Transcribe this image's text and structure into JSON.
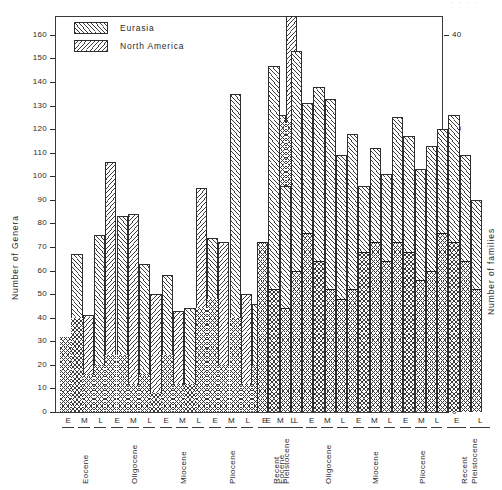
{
  "figure": {
    "left_axis_title": "Number  of  Genera",
    "right_axis_title": "Number  of  families",
    "top_partial_note": "· · · ·"
  },
  "legend": {
    "position": "top-left-inside",
    "entries": [
      {
        "label": "Eurasia",
        "pattern": "diagonal-up-hatch"
      },
      {
        "label": "North America",
        "pattern": "diagonal-down-hatch"
      }
    ]
  },
  "axes": {
    "left": {
      "label": "Number  of  Genera",
      "min": 0,
      "max": 168,
      "tick_step": 10,
      "ticks": [
        0,
        10,
        20,
        30,
        40,
        50,
        60,
        70,
        80,
        90,
        100,
        110,
        120,
        130,
        140,
        150,
        160
      ],
      "tick_labels": [
        "0",
        "10",
        "20",
        "30",
        "40",
        "50",
        "60",
        "70",
        "80",
        "90",
        "100",
        "110",
        "120",
        "130",
        "140",
        "150",
        "160"
      ]
    },
    "right": {
      "label": "Number  of  families",
      "min": 0,
      "max": 42,
      "tick_step": 10,
      "ticks": [
        0,
        10,
        20,
        30,
        40
      ],
      "tick_labels": [
        "0",
        "10",
        "20",
        "30",
        "40"
      ]
    },
    "x": {
      "stage_labels": [
        "E",
        "M",
        "L"
      ],
      "periods": [
        "Eocene",
        "Oligocene",
        "Miocene",
        "Pliocene",
        "Pleistocene Recent"
      ]
    }
  },
  "chart_data": {
    "type": "bar",
    "title": "",
    "subtitle": "",
    "xlabel": "",
    "ylabel": "Number of Genera",
    "ylabel_secondary": "Number of families",
    "ylim": [
      0,
      168
    ],
    "ylim_secondary": [
      0,
      42
    ],
    "grid": false,
    "legend_position": "upper left",
    "panels": [
      {
        "name": "left-panel",
        "categories": [
          "Eocene E",
          "Eocene M",
          "Eocene L",
          "Oligocene E",
          "Oligocene M",
          "Oligocene L",
          "Miocene E",
          "Miocene M",
          "Miocene L",
          "Pliocene E",
          "Pliocene M",
          "Pliocene L"
        ],
        "series": [
          {
            "name": "Eurasia",
            "pattern": "diagonal-up-hatch",
            "genera": [
              19,
              67,
              75,
              106,
              83,
              84,
              63,
              58,
              43,
              95,
              74,
              50
            ],
            "families": [
              8,
              10,
              5,
              6,
              5,
              3,
              6,
              3,
              2,
              11,
              6,
              2
            ]
          },
          {
            "name": "North America",
            "pattern": "diagonal-down-hatch",
            "genera": [
              null,
              41,
              null,
              null,
              null,
              null,
              null,
              44,
              46,
              72,
              135,
              70
            ],
            "families": [
              null,
              4,
              null,
              null,
              null,
              null,
              null,
              4,
              3,
              10,
              8,
              2
            ]
          }
        ]
      },
      {
        "name": "left-panel-pleistocene",
        "categories": [
          "Pleistocene Recent E",
          "Pleistocene Recent L"
        ],
        "series": [
          {
            "name": "Eurasia",
            "genera": [
              126,
              168
            ],
            "families": [
              31,
              31
            ]
          },
          {
            "name": "North America",
            "genera": [
              113,
              78
            ],
            "families": [
              31,
              32
            ]
          }
        ]
      },
      {
        "name": "right-panel",
        "categories": [
          "Eocene E",
          "Eocene M",
          "Eocene L",
          "Oligocene E",
          "Oligocene M",
          "Oligocene L",
          "Miocene E",
          "Miocene M",
          "Miocene L",
          "Pliocene E",
          "Pliocene M",
          "Pliocene L",
          "Pleistocene Recent E",
          "Pleistocene Recent L"
        ],
        "series": [
          {
            "name": "Eurasia",
            "pattern": "diagonal-up-hatch",
            "values": [
              72,
              147,
              118,
              153,
              131,
              138,
              133,
              101,
              112,
              117,
              103,
              113,
              126,
              109
            ],
            "family_marks": [
              18,
              12,
              19,
              15,
              17,
              14,
              12,
              15,
              17,
              16,
              14,
              16,
              15,
              13
            ]
          },
          {
            "name": "North America",
            "pattern": "diagonal-down-hatch",
            "values": [
              null,
              96,
              null,
              131,
              null,
              109,
              96,
              110,
              125,
              103,
              90,
              120,
              105,
              90
            ],
            "family_marks": [
              null,
              13,
              null,
              16,
              null,
              12,
              14,
              16,
              17,
              13,
              12,
              16,
              14,
              11
            ]
          }
        ]
      }
    ],
    "bars_left": [
      {
        "x": 62,
        "w": 13,
        "genera": 19,
        "family": 8,
        "pattern": "eurasia"
      },
      {
        "x": 75,
        "w": 13,
        "genera": 67,
        "family": 10,
        "pattern": "eurasia"
      },
      {
        "x": 88,
        "w": 13,
        "genera": 41,
        "family": 4,
        "pattern": "na"
      },
      {
        "x": 101,
        "w": 13,
        "genera": 75,
        "family": 5,
        "pattern": "eurasia"
      },
      {
        "x": 114,
        "w": 13,
        "genera": 106,
        "family": 6,
        "pattern": "na"
      },
      {
        "x": 127,
        "w": 13,
        "genera": 83,
        "family": 5,
        "pattern": "eurasia"
      },
      {
        "x": 140,
        "w": 13,
        "genera": 84,
        "family": 3,
        "pattern": "na"
      },
      {
        "x": 153,
        "w": 13,
        "genera": 63,
        "family": 4,
        "pattern": "eurasia"
      },
      {
        "x": 166,
        "w": 13,
        "genera": 50,
        "family": 2,
        "pattern": "na"
      },
      {
        "x": 179,
        "w": 13,
        "genera": 58,
        "family": 6,
        "pattern": "eurasia"
      },
      {
        "x": 192,
        "w": 13,
        "genera": 43,
        "family": 3,
        "pattern": "na"
      },
      {
        "x": 205,
        "w": 13,
        "genera": 95,
        "family": 4,
        "pattern": "eurasia"
      }
    ],
    "annotations": []
  },
  "bar_geometry": {
    "left_panel_bars": [
      {
        "id": "L1",
        "genera": 19,
        "family_level": 8,
        "pattern": "eurasia"
      },
      {
        "id": "L2",
        "genera": 67,
        "family_level": 10,
        "pattern": "eurasia"
      },
      {
        "id": "L3",
        "genera": 41,
        "family_level": 4,
        "pattern": "na"
      },
      {
        "id": "L4",
        "genera": 75,
        "family_level": 5,
        "pattern": "eurasia"
      },
      {
        "id": "L5",
        "genera": 106,
        "family_level": 6,
        "pattern": "na"
      },
      {
        "id": "L6",
        "genera": 83,
        "family_level": 6,
        "pattern": "eurasia"
      },
      {
        "id": "L7",
        "genera": 84,
        "family_level": 3,
        "pattern": "na"
      },
      {
        "id": "L8",
        "genera": 63,
        "family_level": 4,
        "pattern": "eurasia"
      },
      {
        "id": "L9",
        "genera": 50,
        "family_level": 2,
        "pattern": "na"
      },
      {
        "id": "L10",
        "genera": 58,
        "family_level": 6,
        "pattern": "eurasia"
      },
      {
        "id": "L11",
        "genera": 43,
        "family_level": 3,
        "pattern": "na"
      },
      {
        "id": "L12",
        "genera": 44,
        "family_level": 3,
        "pattern": "eurasia"
      },
      {
        "id": "L13",
        "genera": 95,
        "family_level": 11,
        "pattern": "na"
      },
      {
        "id": "L14",
        "genera": 74,
        "family_level": 12,
        "pattern": "eurasia"
      },
      {
        "id": "L15",
        "genera": 72,
        "family_level": 5,
        "pattern": "na"
      },
      {
        "id": "L16",
        "genera": 135,
        "family_level": 10,
        "pattern": "eurasia"
      },
      {
        "id": "L17",
        "genera": 50,
        "family_level": 3,
        "pattern": "na"
      },
      {
        "id": "L18",
        "genera": 46,
        "family_level": 5,
        "pattern": "eurasia"
      },
      {
        "id": "L19",
        "genera": 70,
        "family_level": 8,
        "pattern": "na"
      },
      {
        "id": "L20",
        "genera": 126,
        "family_level": 31,
        "pattern": "eurasia"
      },
      {
        "id": "L21",
        "genera": 168,
        "family_level": 31,
        "pattern": "na"
      },
      {
        "id": "L22",
        "genera": 113,
        "family_level": 32,
        "pattern": "eurasia"
      },
      {
        "id": "L23",
        "genera": 78,
        "family_level": 32,
        "pattern": "na"
      }
    ],
    "right_panel_bars": [
      {
        "id": "R1",
        "genera": 72,
        "family_level": 18,
        "pattern": "cross"
      },
      {
        "id": "R2",
        "genera": 147,
        "family_level": 13,
        "pattern": "cross"
      },
      {
        "id": "R3",
        "genera": 96,
        "family_level": 11,
        "pattern": "cross"
      },
      {
        "id": "R4",
        "genera": 153,
        "family_level": 15,
        "pattern": "cross"
      },
      {
        "id": "R5",
        "genera": 131,
        "family_level": 19,
        "pattern": "cross"
      },
      {
        "id": "R6",
        "genera": 138,
        "family_level": 16,
        "pattern": "cross"
      },
      {
        "id": "R7",
        "genera": 133,
        "family_level": 13,
        "pattern": "cross"
      },
      {
        "id": "R8",
        "genera": 109,
        "family_level": 12,
        "pattern": "cross"
      },
      {
        "id": "R9",
        "genera": 118,
        "family_level": 13,
        "pattern": "cross"
      },
      {
        "id": "R10",
        "genera": 96,
        "family_level": 17,
        "pattern": "cross"
      },
      {
        "id": "R11",
        "genera": 112,
        "family_level": 18,
        "pattern": "cross"
      },
      {
        "id": "R12",
        "genera": 101,
        "family_level": 16,
        "pattern": "cross"
      },
      {
        "id": "R13",
        "genera": 125,
        "family_level": 18,
        "pattern": "cross"
      },
      {
        "id": "R14",
        "genera": 117,
        "family_level": 17,
        "pattern": "cross"
      },
      {
        "id": "R15",
        "genera": 103,
        "family_level": 14,
        "pattern": "cross"
      },
      {
        "id": "R16",
        "genera": 113,
        "family_level": 15,
        "pattern": "cross"
      },
      {
        "id": "R17",
        "genera": 120,
        "family_level": 19,
        "pattern": "cross"
      },
      {
        "id": "R18",
        "genera": 126,
        "family_level": 18,
        "pattern": "cross"
      },
      {
        "id": "R19",
        "genera": 109,
        "family_level": 16,
        "pattern": "cross"
      },
      {
        "id": "R20",
        "genera": 90,
        "family_level": 13,
        "pattern": "cross"
      }
    ]
  }
}
